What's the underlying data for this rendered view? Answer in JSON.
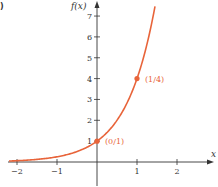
{
  "panel_label": ")",
  "chart_data": {
    "type": "line",
    "title": "",
    "function": "f(x) = 4^x",
    "xlabel": "x",
    "ylabel": "f(x)",
    "xlim": [
      -2.2,
      2.9
    ],
    "ylim": [
      -1.2,
      7.6
    ],
    "x_ticks": [
      -2,
      -1,
      1,
      2
    ],
    "x_tick_labels": [
      "−2",
      "−1",
      "1",
      "2"
    ],
    "y_ticks": [
      1,
      2,
      3,
      4,
      5,
      6,
      7
    ],
    "y_tick_labels": [
      "1",
      "2",
      "3",
      "4",
      "5",
      "6",
      "7"
    ],
    "grid": false,
    "legend": null,
    "series": [
      {
        "name": "f(x)",
        "color": "#e8643a",
        "x": [
          -2.2,
          -2,
          -1.5,
          -1,
          -0.5,
          0,
          0.25,
          0.5,
          0.75,
          1,
          1.25,
          1.45
        ],
        "y": [
          0.047,
          0.0625,
          0.125,
          0.25,
          0.5,
          1,
          1.414,
          2,
          2.828,
          4,
          5.657,
          7.464
        ]
      }
    ],
    "points": [
      {
        "x": 0,
        "y": 1,
        "label": "(0/1)"
      },
      {
        "x": 1,
        "y": 4,
        "label": "(1/4)"
      }
    ],
    "colors": {
      "curve": "#e8643a",
      "axis": "#333333"
    }
  }
}
